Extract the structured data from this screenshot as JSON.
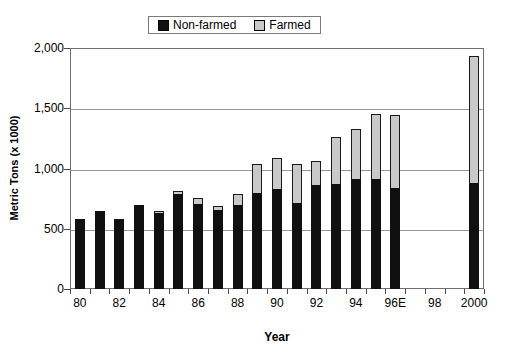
{
  "chart_data": {
    "type": "bar",
    "subtype": "stacked-bar",
    "title": "",
    "xlabel": "Year",
    "ylabel": "Metric Tons (x 1000)",
    "ylim": [
      0,
      2000
    ],
    "yticks": [
      "0",
      "500",
      "1,000",
      "1,500",
      "2,000"
    ],
    "ytick_values": [
      0,
      500,
      1000,
      1500,
      2000
    ],
    "grid": true,
    "grid_axis": "y",
    "legend_position": "top-center",
    "categories": [
      "80",
      "81",
      "82",
      "83",
      "84",
      "85",
      "86",
      "87",
      "88",
      "89",
      "90",
      "91",
      "92",
      "93",
      "94",
      "95",
      "96E",
      "97",
      "98",
      "99",
      "2000"
    ],
    "xtick_labels": [
      "80",
      "82",
      "84",
      "86",
      "88",
      "90",
      "92",
      "94",
      "96E",
      "98",
      "2000"
    ],
    "series": [
      {
        "name": "Non-farmed",
        "color": "#101010",
        "values": [
          580,
          650,
          570,
          695,
          630,
          790,
          705,
          655,
          700,
          800,
          830,
          710,
          865,
          870,
          910,
          915,
          840,
          null,
          null,
          null,
          880
        ]
      },
      {
        "name": "Farmed",
        "color": "#c9c9c9",
        "values": [
          0,
          0,
          10,
          0,
          15,
          25,
          50,
          35,
          85,
          235,
          255,
          330,
          200,
          390,
          420,
          540,
          600,
          null,
          null,
          null,
          1050
        ]
      }
    ],
    "totals": [
      580,
      650,
      580,
      695,
      645,
      815,
      755,
      690,
      785,
      1035,
      1085,
      1040,
      1065,
      1260,
      1330,
      1455,
      1440,
      null,
      null,
      null,
      1930
    ]
  },
  "legend": {
    "entries": [
      {
        "label": "Non-farmed",
        "swatch": "black-square-icon"
      },
      {
        "label": "Farmed",
        "swatch": "light-gray-square-icon"
      }
    ]
  },
  "axes": {
    "y_title": "Metric Tons (x 1000)",
    "x_title": "Year"
  }
}
